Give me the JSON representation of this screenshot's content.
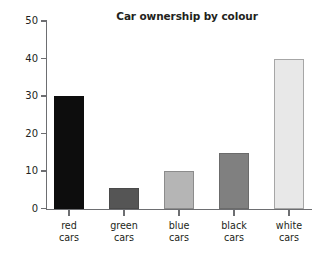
{
  "chart_data": {
    "type": "bar",
    "title": "Car ownership by colour",
    "xlabel": "",
    "ylabel": "",
    "categories": [
      "red cars",
      "green cars",
      "blue cars",
      "black cars",
      "white cars"
    ],
    "category_lines": [
      [
        "red",
        "cars"
      ],
      [
        "green",
        "cars"
      ],
      [
        "blue",
        "cars"
      ],
      [
        "black",
        "cars"
      ],
      [
        "white",
        "cars"
      ]
    ],
    "values": [
      30,
      5.5,
      10,
      15,
      40
    ],
    "bar_colors": [
      "#0d0d0d",
      "#555555",
      "#b5b5b5",
      "#808080",
      "#e8e8e8"
    ],
    "bar_border_colors": [
      "#0d0d0d",
      "#4a4a4a",
      "#8c8c8c",
      "#6b6b6b",
      "#a6a6a6"
    ],
    "ylim": [
      0,
      50
    ],
    "yticks": [
      0,
      10,
      20,
      30,
      40,
      50
    ],
    "ytick_labels": [
      "0",
      "10",
      "20",
      "30",
      "40",
      "50"
    ],
    "grid": false,
    "legend": "none"
  }
}
